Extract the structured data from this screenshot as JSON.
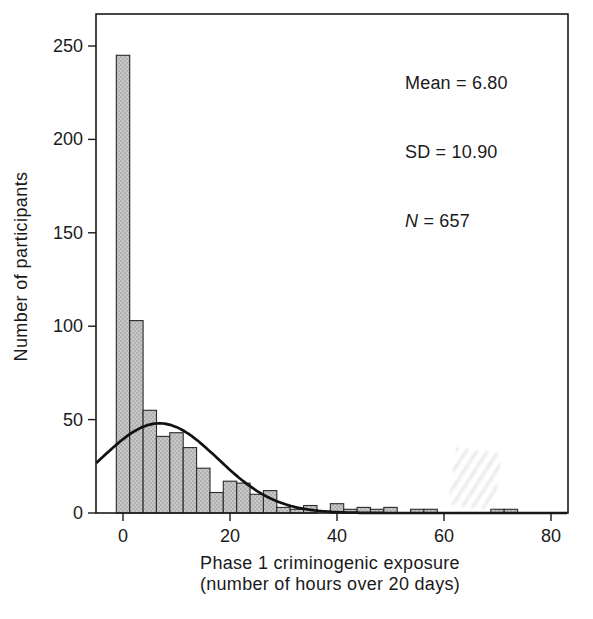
{
  "figure": {
    "y_axis_title": "Number of participants",
    "x_axis_title_line1": "Phase 1 criminogenic exposure",
    "x_axis_title_line2": "(number of hours over 20 days)"
  },
  "stats": {
    "mean": "Mean = 6.80",
    "sd": "SD = 10.90",
    "n_symbol": "N",
    "n_rest": " = 657"
  },
  "chart_data": {
    "type": "bar",
    "subtype": "histogram-with-normal-curve",
    "title": "",
    "xlabel": "Phase 1 criminogenic exposure (number of hours over 20 days)",
    "ylabel": "Number of participants",
    "xlim": [
      -5,
      83
    ],
    "ylim": [
      0,
      265
    ],
    "x_ticks": [
      0,
      20,
      40,
      60,
      80
    ],
    "y_ticks": [
      0,
      50,
      100,
      150,
      200,
      250
    ],
    "grid": false,
    "legend_position": "none",
    "bin_width": 2.5,
    "bins": [
      {
        "center": 0,
        "count": 245
      },
      {
        "center": 2.5,
        "count": 103
      },
      {
        "center": 5,
        "count": 55
      },
      {
        "center": 7.5,
        "count": 41
      },
      {
        "center": 10,
        "count": 43
      },
      {
        "center": 12.5,
        "count": 35
      },
      {
        "center": 15,
        "count": 24
      },
      {
        "center": 17.5,
        "count": 11
      },
      {
        "center": 20,
        "count": 17
      },
      {
        "center": 22.5,
        "count": 16
      },
      {
        "center": 25,
        "count": 10
      },
      {
        "center": 27.5,
        "count": 12
      },
      {
        "center": 30,
        "count": 3
      },
      {
        "center": 32.5,
        "count": 2
      },
      {
        "center": 35,
        "count": 4
      },
      {
        "center": 40,
        "count": 5
      },
      {
        "center": 42.5,
        "count": 2
      },
      {
        "center": 45,
        "count": 3
      },
      {
        "center": 47.5,
        "count": 2
      },
      {
        "center": 50,
        "count": 3
      },
      {
        "center": 55,
        "count": 2
      },
      {
        "center": 57.5,
        "count": 2
      },
      {
        "center": 70,
        "count": 2
      },
      {
        "center": 72.5,
        "count": 2
      }
    ],
    "normal_curve": {
      "mean": 6.8,
      "sd": 10.9,
      "peak": 48
    },
    "annotations": [
      "Mean = 6.80",
      "SD = 10.90",
      "N = 657"
    ],
    "colors": {
      "bar_fill": "#c7c7c7",
      "bar_stipple": "#8a8a8a",
      "bar_stroke": "#2b2b2b",
      "curve": "#111111",
      "frame": "#1a1a1a",
      "text": "#1a1a1a",
      "background": "#ffffff"
    }
  }
}
